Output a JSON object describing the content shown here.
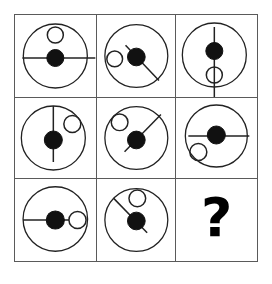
{
  "puzzle": {
    "type": "ravens-progressive-matrix",
    "title": "",
    "rows": 3,
    "columns": 3,
    "frame_color": "#5a5a5a",
    "stroke_color": "#000000",
    "fill_color": "#000000",
    "background_color": "#ffffff",
    "missing_cell_index": 8,
    "missing_cell_glyph": "?",
    "cells": [
      {
        "index": 0,
        "name": "cell-r1c1",
        "description": "Large circle with horizontal line through center, filled dot at center, small open circle above center",
        "big_circle": true,
        "center_dot": "filled",
        "line_orientation": "horizontal",
        "small_circle_position": "above-center"
      },
      {
        "index": 1,
        "name": "cell-r1c2",
        "description": "Large circle with diagonal line from upper-left to lower-right, filled dot at center, small open circle left of center",
        "big_circle": true,
        "center_dot": "filled",
        "line_orientation": "diagonal-nwse",
        "small_circle_position": "left-of-center"
      },
      {
        "index": 2,
        "name": "cell-r1c3",
        "description": "Large circle with vertical line through center, filled dot at center, small open circle below center",
        "big_circle": true,
        "center_dot": "filled",
        "line_orientation": "vertical",
        "small_circle_position": "below-center"
      },
      {
        "index": 3,
        "name": "cell-r2c1",
        "description": "Large circle with vertical line through center, filled dot at center, small open circle upper-right",
        "big_circle": true,
        "center_dot": "filled",
        "line_orientation": "vertical",
        "small_circle_position": "upper-right"
      },
      {
        "index": 4,
        "name": "cell-r2c2",
        "description": "Large circle with diagonal line from lower-left to upper-right, filled dot at center, small open circle upper-left",
        "big_circle": true,
        "center_dot": "filled",
        "line_orientation": "diagonal-swne",
        "small_circle_position": "upper-left"
      },
      {
        "index": 5,
        "name": "cell-r2c3",
        "description": "Large circle with horizontal line through center, filled dot at center, small open circle lower-left",
        "big_circle": true,
        "center_dot": "filled",
        "line_orientation": "horizontal",
        "small_circle_position": "lower-left"
      },
      {
        "index": 6,
        "name": "cell-r3c1",
        "description": "Large circle with horizontal line through center, filled dot at center, small open circle right of center on the line",
        "big_circle": true,
        "center_dot": "filled",
        "line_orientation": "horizontal",
        "small_circle_position": "right-of-center"
      },
      {
        "index": 7,
        "name": "cell-r3c2",
        "description": "Large circle with diagonal line from upper-left to lower-right, filled dot at center, small open circle above right of center",
        "big_circle": true,
        "center_dot": "filled",
        "line_orientation": "diagonal-nwse",
        "small_circle_position": "above-right"
      },
      {
        "index": 8,
        "name": "cell-r3c3-missing",
        "description": "Missing element shown as a bold question mark",
        "big_circle": false,
        "center_dot": "none",
        "line_orientation": "none",
        "small_circle_position": "none",
        "glyph": "?"
      }
    ]
  }
}
